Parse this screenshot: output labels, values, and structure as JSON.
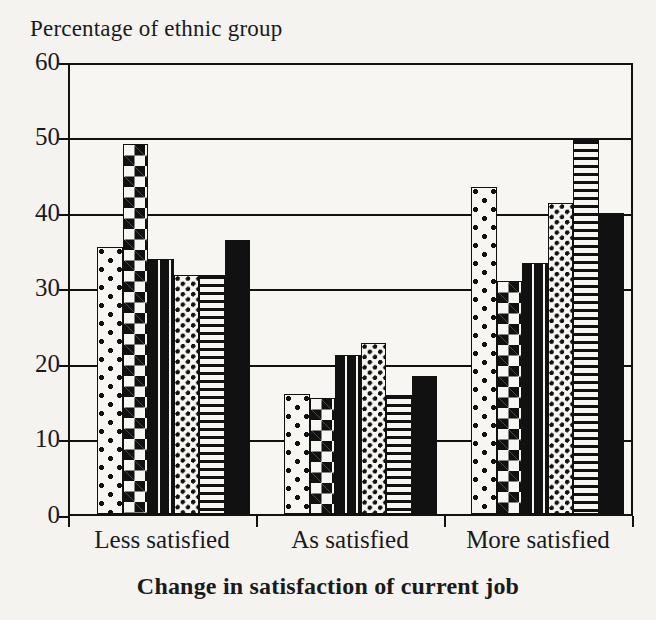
{
  "chart_data": {
    "type": "bar",
    "title": "",
    "ylabel": "Percentage of ethnic group",
    "xlabel": "Change in satisfaction of current job",
    "categories": [
      "Less satisfied",
      "As satisfied",
      "More satisfied"
    ],
    "ylim": [
      0,
      60
    ],
    "yticks": [
      0,
      10,
      20,
      30,
      40,
      50,
      60
    ],
    "grid": true,
    "legend": "none",
    "series": [
      {
        "name": "Group 1",
        "pattern": "sparse-dots",
        "values": [
          35.7,
          16.0,
          43.7
        ]
      },
      {
        "name": "Group 2",
        "pattern": "checkerboard",
        "values": [
          49.5,
          15.5,
          31.1
        ]
      },
      {
        "name": "Group 3",
        "pattern": "dashes",
        "values": [
          34.1,
          21.2,
          33.6
        ]
      },
      {
        "name": "Group 4",
        "pattern": "dense-dots",
        "values": [
          31.9,
          22.8,
          41.5
        ]
      },
      {
        "name": "Group 5",
        "pattern": "horizontal-lines",
        "values": [
          31.9,
          15.9,
          50.0
        ]
      },
      {
        "name": "Group 6",
        "pattern": "solid-black",
        "values": [
          36.6,
          18.4,
          40.2
        ]
      }
    ]
  },
  "axis": {
    "y_title": "Percentage of ethnic group",
    "x_title": "Change in satisfaction of current job",
    "y_tick_labels": [
      "60",
      "50",
      "40",
      "30",
      "20",
      "10",
      "0"
    ],
    "x_tick_labels": [
      "Less satisfied",
      "As satisfied",
      "More satisfied"
    ]
  },
  "colors": {
    "ink": "#111111",
    "paper": "#f4f3ef",
    "plot_background": "#f7f6f2"
  }
}
